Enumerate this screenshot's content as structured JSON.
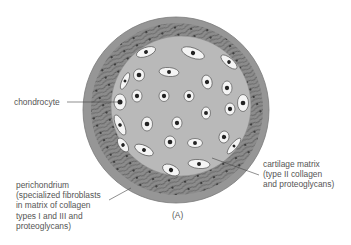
{
  "figure": {
    "panel_label": "(A)",
    "colors": {
      "background": "#ffffff",
      "perichondrium": "#8f8f8f",
      "cartilage_matrix": "#b8b8b8",
      "cell": "#f4f4f4",
      "nucleus": "#222222",
      "text": "#555555",
      "leader": "#444444"
    }
  },
  "labels": {
    "chondrocyte": "chondrocyte",
    "cartilage_matrix": {
      "line1": "cartilage matrix",
      "line2": "(type II collagen",
      "line3": "and proteoglycans)"
    },
    "perichondrium": {
      "line1": "perichondrium",
      "line2": "(specialized fibroblasts",
      "line3": "in matrix of collagen",
      "line4": "types I and III and",
      "line5": "proteoglycans)"
    }
  },
  "chondrocytes": [
    [
      146,
      52,
      10,
      4.5,
      -20
    ],
    [
      193,
      53,
      12,
      5,
      20
    ],
    [
      229,
      62,
      10,
      4,
      40
    ],
    [
      125,
      81,
      3,
      9,
      25
    ],
    [
      139,
      75,
      5.5,
      6,
      0
    ],
    [
      169,
      72,
      10,
      4.5,
      5
    ],
    [
      207,
      82,
      5,
      7,
      -15
    ],
    [
      227,
      88,
      5,
      7,
      0
    ],
    [
      243,
      103,
      5.5,
      8.5,
      0
    ],
    [
      120,
      102,
      6,
      8,
      0
    ],
    [
      137,
      96,
      5,
      6,
      0
    ],
    [
      164,
      96,
      5,
      5.5,
      0
    ],
    [
      189,
      96,
      5,
      5.5,
      0
    ],
    [
      206,
      113,
      4.5,
      6,
      0
    ],
    [
      230,
      109,
      5,
      6,
      0
    ],
    [
      120,
      125,
      4,
      11,
      -25
    ],
    [
      147,
      124,
      5.5,
      7,
      0
    ],
    [
      177,
      123,
      5,
      6,
      0
    ],
    [
      123,
      145,
      4,
      8,
      -35
    ],
    [
      144,
      150,
      10,
      4.5,
      25
    ],
    [
      170,
      142,
      5.5,
      6,
      0
    ],
    [
      195,
      143,
      7.5,
      4.5,
      0
    ],
    [
      224,
      137,
      5,
      6,
      10
    ],
    [
      234,
      146,
      3,
      10,
      40
    ],
    [
      199,
      164,
      11,
      4.5,
      5
    ],
    [
      171,
      170,
      9,
      5,
      25
    ]
  ]
}
